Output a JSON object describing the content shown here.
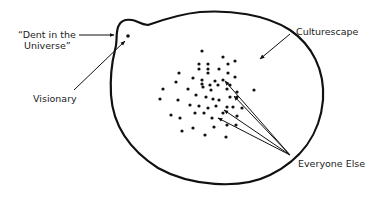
{
  "colors": {
    "ink": "#111111",
    "text": "#222222",
    "background": "#ffffff"
  },
  "labels": {
    "dent_line1": "“Dent in the",
    "dent_line2": "Universe”",
    "visionary": "Visionary",
    "culturescape": "Culturescape",
    "everyone_else": "Everyone Else"
  },
  "shapes": {
    "culturescape_boundary": "M 119 25 C 115 32, 118 40, 115 50 C 112 62, 110 78, 111 95 C 113 125, 130 150, 158 168 C 190 186, 240 190, 270 175 C 300 160, 320 135, 323 100 C 325 70, 312 45, 290 30 C 265 14, 230 10, 200 12 C 180 14, 162 20, 148 25 C 140 24, 138 21, 132 20 C 124 19, 121 21, 119 25 Z",
    "visionary_dot": {
      "x": 128,
      "y": 36,
      "r": 1.8
    }
  },
  "dots": [
    [
      202,
      51
    ],
    [
      223,
      57
    ],
    [
      235,
      61
    ],
    [
      199,
      64
    ],
    [
      208,
      64
    ],
    [
      228,
      64
    ],
    [
      199,
      69
    ],
    [
      208,
      69
    ],
    [
      219,
      69
    ],
    [
      179,
      73
    ],
    [
      208,
      73
    ],
    [
      228,
      73
    ],
    [
      235,
      77
    ],
    [
      193,
      78
    ],
    [
      202,
      80
    ],
    [
      176,
      82
    ],
    [
      215,
      81
    ],
    [
      223,
      80
    ],
    [
      202,
      84
    ],
    [
      210,
      85
    ],
    [
      218,
      85
    ],
    [
      230,
      85
    ],
    [
      163,
      89
    ],
    [
      188,
      89
    ],
    [
      203,
      87
    ],
    [
      211,
      90
    ],
    [
      227,
      89
    ],
    [
      237,
      92
    ],
    [
      254,
      90
    ],
    [
      160,
      99
    ],
    [
      178,
      100
    ],
    [
      196,
      95
    ],
    [
      206,
      97
    ],
    [
      213,
      99
    ],
    [
      219,
      100
    ],
    [
      230,
      97
    ],
    [
      237,
      97
    ],
    [
      190,
      105
    ],
    [
      199,
      106
    ],
    [
      208,
      108
    ],
    [
      216,
      106
    ],
    [
      227,
      107
    ],
    [
      233,
      107
    ],
    [
      242,
      108
    ],
    [
      171,
      115
    ],
    [
      180,
      118
    ],
    [
      195,
      113
    ],
    [
      204,
      113
    ],
    [
      212,
      118
    ],
    [
      223,
      113
    ],
    [
      237,
      116
    ],
    [
      182,
      131
    ],
    [
      193,
      128
    ],
    [
      214,
      127
    ],
    [
      227,
      125
    ],
    [
      236,
      125
    ],
    [
      205,
      135
    ],
    [
      226,
      137
    ]
  ],
  "arrows": [
    {
      "name": "dent-arrow",
      "from": [
        79,
        35
      ],
      "to": [
        114,
        35
      ]
    },
    {
      "name": "visionary-arrow",
      "from": [
        74,
        90
      ],
      "to": [
        125,
        41
      ]
    },
    {
      "name": "culturescape-arrow",
      "from": [
        290,
        34
      ],
      "to": [
        260,
        59
      ]
    },
    {
      "name": "everyone-arrow-1",
      "from": [
        290,
        155
      ],
      "to": [
        225,
        81
      ]
    },
    {
      "name": "everyone-arrow-2",
      "from": [
        290,
        155
      ],
      "to": [
        234,
        96
      ]
    },
    {
      "name": "everyone-arrow-3",
      "from": [
        290,
        155
      ],
      "to": [
        224,
        110
      ]
    },
    {
      "name": "everyone-arrow-4",
      "from": [
        290,
        155
      ],
      "to": [
        218,
        118
      ]
    }
  ]
}
